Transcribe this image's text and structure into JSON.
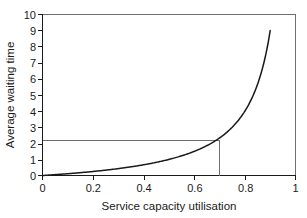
{
  "chart_data": {
    "type": "line",
    "title": "",
    "xlabel": "Service capacity utilisation",
    "ylabel": "Average waiting time",
    "xlim": [
      0,
      1
    ],
    "ylim": [
      0,
      10
    ],
    "grid": false,
    "legend": null,
    "xticks": [
      "0",
      "0.2",
      "0.4",
      "0.6",
      "0.8",
      "1"
    ],
    "xtick_values": [
      0,
      0.2,
      0.4,
      0.6,
      0.8,
      1
    ],
    "yticks": [
      "0",
      "1",
      "2",
      "3",
      "4",
      "5",
      "6",
      "7",
      "8",
      "9",
      "10"
    ],
    "ytick_values": [
      0,
      1,
      2,
      3,
      4,
      5,
      6,
      7,
      8,
      9,
      10
    ],
    "series": [
      {
        "name": "Average waiting time",
        "formula": "W = rho / (1 - rho)",
        "x": [
          0.0,
          0.05,
          0.1,
          0.15,
          0.2,
          0.25,
          0.3,
          0.35,
          0.4,
          0.45,
          0.5,
          0.55,
          0.6,
          0.65,
          0.7,
          0.75,
          0.8,
          0.82,
          0.84,
          0.86,
          0.88,
          0.89,
          0.9
        ],
        "values": [
          0.0,
          0.05,
          0.11,
          0.18,
          0.25,
          0.33,
          0.43,
          0.54,
          0.67,
          0.82,
          1.0,
          1.22,
          1.5,
          1.86,
          2.33,
          3.0,
          4.0,
          4.56,
          5.25,
          6.14,
          7.33,
          8.09,
          9.0
        ]
      }
    ],
    "annotations": [
      {
        "name": "reference-lines",
        "x": 0.7,
        "y": 2.2,
        "description": "horizontal line from y-axis at 2.2 to curve, then vertical line down to x-axis at 0.7"
      }
    ]
  },
  "axes": {
    "x_title": "Service capacity utilisation",
    "y_title": "Average waiting time"
  },
  "colors": {
    "curve": "#1a1a1a",
    "axis": "#1a1a1a",
    "frame": "#6f6f6f",
    "reference": "#6f6f6f",
    "background": "#ffffff"
  }
}
